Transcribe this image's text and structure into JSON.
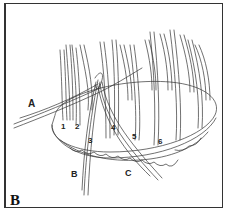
{
  "figure": {
    "panel_label": "B",
    "weaver_labels": [
      "A",
      "B",
      "C"
    ],
    "stake_numbers": [
      "1",
      "2",
      "3",
      "4",
      "5",
      "6"
    ]
  },
  "colors": {
    "ink": "#333333",
    "background": "#ffffff"
  }
}
